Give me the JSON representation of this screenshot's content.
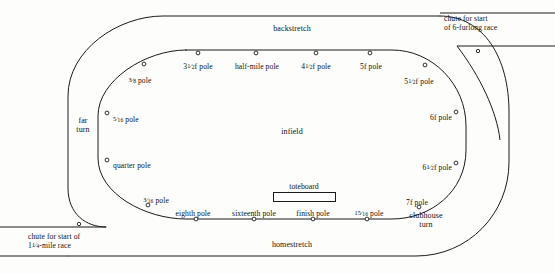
{
  "diagram": {
    "type": "racetrack-schematic",
    "ink_color": "#1a1a1a",
    "background_color": "#fdfdfc"
  },
  "regions": [
    {
      "name": "backstretch",
      "label": "backstretch",
      "x": 292,
      "y": 29,
      "align": "centered"
    },
    {
      "name": "homestretch",
      "label": "homestretch",
      "x": 292,
      "y": 243,
      "align": "centered"
    },
    {
      "name": "infield",
      "label": "infield",
      "x": 292,
      "y": 130,
      "align": "centered"
    },
    {
      "name": "far-turn",
      "label": "far\nturn",
      "x": 83,
      "y": 120,
      "align": "centered"
    },
    {
      "name": "clubhouse-turn",
      "label": "clubhouse\nturn",
      "x": 424,
      "y": 215,
      "align": "centered"
    }
  ],
  "chutes": [
    {
      "name": "chute-six-furlong",
      "label": "chute for start\nof 6-furlong race",
      "x": 481,
      "y": 18,
      "align": "centered",
      "marker": {
        "x": 478,
        "y": 51
      }
    },
    {
      "name": "chute-mile-and-quarter",
      "label_line1": "chute for start of",
      "label_line2_prefix": "1",
      "label_line2_frac_num": "1",
      "label_line2_frac_den": "4",
      "label_line2_suffix": "-mile race",
      "x": 29,
      "y": 232,
      "align": "left",
      "marker": {
        "x": 79,
        "y": 224
      }
    }
  ],
  "toteboard": {
    "name": "toteboard",
    "label": "toteboard",
    "label_x": 304,
    "label_y": 184,
    "box_x": 273,
    "box_y": 193,
    "box_w": 63,
    "box_h": 10
  },
  "poles": [
    {
      "name": "pole-three-eighths",
      "text_plain": "3/8 pole",
      "prefix": "",
      "num": "3",
      "den": "8",
      "suffix": " pole",
      "label_x": 140,
      "label_y": 76,
      "align": "centered",
      "dot_x": 144,
      "dot_y": 64
    },
    {
      "name": "pole-three-and-half-f",
      "text_plain": "3 1/2 f pole",
      "prefix": "3",
      "num": "1",
      "den": "2",
      "suffix": "f pole",
      "label_x": 198,
      "label_y": 62,
      "align": "centered",
      "dot_x": 198,
      "dot_y": 53
    },
    {
      "name": "pole-half-mile",
      "text_plain": "half-mile pole",
      "prefix": "",
      "num": "",
      "den": "",
      "suffix": "half-mile pole",
      "label_x": 257,
      "label_y": 62,
      "align": "centered",
      "dot_x": 256,
      "dot_y": 53
    },
    {
      "name": "pole-four-and-half-f",
      "text_plain": "4 1/2 f pole",
      "prefix": "4",
      "num": "1",
      "den": "2",
      "suffix": "f pole",
      "label_x": 316,
      "label_y": 62,
      "align": "centered",
      "dot_x": 316,
      "dot_y": 53
    },
    {
      "name": "pole-five-f",
      "text_plain": "5f pole",
      "prefix": "",
      "num": "",
      "den": "",
      "suffix": "5f pole",
      "label_x": 371,
      "label_y": 62,
      "align": "centered",
      "dot_x": 370,
      "dot_y": 53
    },
    {
      "name": "pole-five-and-half-f",
      "text_plain": "5 1/2 f pole",
      "prefix": "5",
      "num": "1",
      "den": "2",
      "suffix": "f pole",
      "label_x": 419,
      "label_y": 77,
      "align": "centered",
      "dot_x": 425,
      "dot_y": 65
    },
    {
      "name": "pole-six-f",
      "text_plain": "6f pole",
      "prefix": "",
      "num": "",
      "den": "",
      "suffix": "6f pole",
      "label_x": 452,
      "label_y": 113,
      "align": "righted",
      "dot_x": 456,
      "dot_y": 112
    },
    {
      "name": "pole-five-sixteenths",
      "text_plain": "5/16 pole",
      "prefix": "",
      "num": "5",
      "den": "16",
      "suffix": " pole",
      "label_x": 113,
      "label_y": 115,
      "align": "left",
      "dot_x": 107,
      "dot_y": 113
    },
    {
      "name": "pole-quarter",
      "text_plain": "quarter pole",
      "prefix": "",
      "num": "",
      "den": "",
      "suffix": "quarter pole",
      "label_x": 113,
      "label_y": 161,
      "align": "left",
      "dot_x": 107,
      "dot_y": 160
    },
    {
      "name": "pole-six-and-half-f",
      "text_plain": "6 1/2 f pole",
      "prefix": "6",
      "num": "1",
      "den": "2",
      "suffix": "f pole",
      "label_x": 452,
      "label_y": 163,
      "align": "righted",
      "dot_x": 456,
      "dot_y": 163
    },
    {
      "name": "pole-three-sixteenths",
      "text_plain": "3/16 pole",
      "prefix": "",
      "num": "3",
      "den": "16",
      "suffix": " pole",
      "label_x": 156,
      "label_y": 196,
      "align": "centered",
      "dot_x": 148,
      "dot_y": 205
    },
    {
      "name": "pole-eighth",
      "text_plain": "eighth pole",
      "prefix": "",
      "num": "",
      "den": "",
      "suffix": "eighth pole",
      "label_x": 193,
      "label_y": 209,
      "align": "centered",
      "dot_x": 196,
      "dot_y": 219
    },
    {
      "name": "pole-sixteenth",
      "text_plain": "sixteenth pole",
      "prefix": "",
      "num": "",
      "den": "",
      "suffix": "sixteenth pole",
      "label_x": 254,
      "label_y": 209,
      "align": "centered",
      "dot_x": 254,
      "dot_y": 219
    },
    {
      "name": "pole-finish",
      "text_plain": "finish pole",
      "prefix": "",
      "num": "",
      "den": "",
      "suffix": "finish pole",
      "label_x": 313,
      "label_y": 209,
      "align": "centered",
      "dot_x": 313,
      "dot_y": 219
    },
    {
      "name": "pole-fifteen-sixteenths",
      "text_plain": "15/16 pole",
      "prefix": "",
      "num": "15",
      "den": "16",
      "suffix": " pole",
      "label_x": 369,
      "label_y": 209,
      "align": "centered",
      "dot_x": 367,
      "dot_y": 219
    },
    {
      "name": "pole-seven-f",
      "text_plain": "7f pole",
      "prefix": "",
      "num": "",
      "den": "",
      "suffix": "7f pole",
      "label_x": 417,
      "label_y": 198,
      "align": "centered",
      "dot_x": 419,
      "dot_y": 207
    }
  ],
  "geometry": {
    "outer_rail_path": "M 300 16 L 163 16 C 120 16 68 48 68 94 L 68 180 C 68 212 92 228 113 228",
    "outer_rail_path_right": "M 300 16 L 440 16",
    "inner_rail_path": "M 310 50 L 186 50 C 146 50 98 80 98 118 L 98 160 C 98 196 140 219 178 219 L 310 219",
    "inner_rail_right_path": "M 310 50 L 390 50 C 430 50 466 82 466 126 L 466 150 C 466 190 430 219 392 219 L 310 219",
    "outer_rail_right_path": "M 440 16 C 480 16 508 56 508 110 L 508 160 C 508 210 470 252 420 252 L 300 252",
    "outer_bottom_left": "M 113 228 L 300 252"
  }
}
